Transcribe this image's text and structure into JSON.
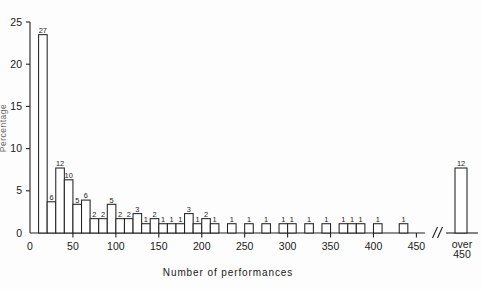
{
  "figure": {
    "background": "#fdfdfd",
    "ink_color": "#222222"
  },
  "axes": {
    "x_title": "Number of performances",
    "y_title": "Percentage",
    "x_ticks": [
      "0",
      "50",
      "100",
      "150",
      "200",
      "250",
      "300",
      "350",
      "400",
      "450"
    ],
    "x_tick_values": [
      0,
      50,
      100,
      150,
      200,
      250,
      300,
      350,
      400,
      450
    ],
    "x_break_label_line1": "over",
    "x_break_label_line2": "450",
    "y_ticks": [
      "0",
      "5",
      "10",
      "15",
      "20",
      "25"
    ],
    "y_tick_values": [
      0,
      5,
      10,
      15,
      20,
      25
    ],
    "axis_break_symbol": "//"
  },
  "chart_data": {
    "type": "bar",
    "title": "",
    "subtitle": "",
    "xlabel": "Number of performances",
    "ylabel": "Percentage",
    "xlim": [
      0,
      460
    ],
    "ylim": [
      0,
      25
    ],
    "grid": false,
    "legend": null,
    "bin_width": 10,
    "note": "Histogram of number of performances. Bar labels show counts; bar heights show percentage. The final bar is an overflow category beyond an axis break.",
    "categories": [
      "10-20",
      "20-30",
      "30-40",
      "40-50",
      "50-60",
      "60-70",
      "70-80",
      "80-90",
      "90-100",
      "100-110",
      "110-120",
      "120-130",
      "130-140",
      "140-150",
      "150-160",
      "160-170",
      "170-180",
      "180-190",
      "190-200",
      "200-210",
      "210-220",
      "230-240",
      "250-260",
      "270-280",
      "290-300",
      "300-310",
      "320-330",
      "340-350",
      "360-370",
      "370-380",
      "380-390",
      "400-410",
      "430-440",
      "over 450"
    ],
    "bin_starts": [
      10,
      20,
      30,
      40,
      50,
      60,
      70,
      80,
      90,
      100,
      110,
      120,
      130,
      140,
      150,
      160,
      170,
      180,
      190,
      200,
      210,
      230,
      250,
      270,
      290,
      300,
      320,
      340,
      360,
      370,
      380,
      400,
      430,
      455
    ],
    "counts": [
      27,
      6,
      12,
      10,
      5,
      6,
      2,
      2,
      5,
      2,
      2,
      3,
      1,
      2,
      1,
      1,
      1,
      3,
      1,
      2,
      1,
      1,
      1,
      1,
      1,
      1,
      1,
      1,
      1,
      1,
      1,
      1,
      1,
      12
    ],
    "values": [
      23.5,
      3.7,
      7.7,
      6.3,
      3.4,
      3.9,
      1.7,
      1.7,
      3.4,
      1.7,
      1.7,
      2.3,
      1.1,
      1.7,
      1.1,
      1.1,
      1.1,
      2.3,
      1.1,
      1.7,
      1.1,
      1.1,
      1.1,
      1.1,
      1.1,
      1.1,
      1.1,
      1.1,
      1.1,
      1.1,
      1.1,
      1.1,
      1.1,
      7.7
    ],
    "bar_labels": [
      "27",
      "6",
      "12",
      "10",
      "5",
      "6",
      "2",
      "2",
      "5",
      "2",
      "2",
      "3",
      "1",
      "2",
      "1",
      "1",
      "1",
      "3",
      "1",
      "2",
      "1",
      "1",
      "1",
      "1",
      "1",
      "1",
      "1",
      "1",
      "1",
      "1",
      "1",
      "1",
      "1",
      "12"
    ]
  }
}
